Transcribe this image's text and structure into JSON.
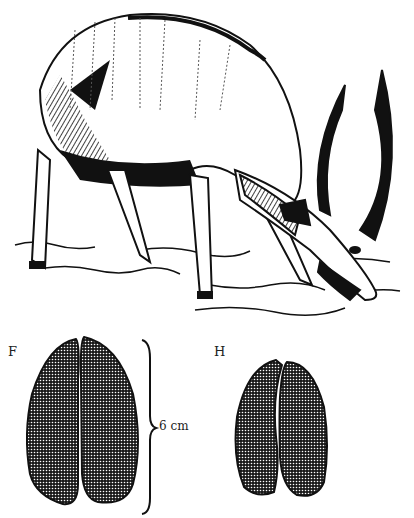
{
  "illustration": {
    "subject": "antelope (nyala) grazing, pen-and-ink drawing",
    "colors": {
      "ink": "#111111",
      "paper": "#ffffff"
    }
  },
  "tracks": {
    "front": {
      "label": "F"
    },
    "hind": {
      "label": "H"
    },
    "scale": {
      "text": "6 cm"
    }
  }
}
